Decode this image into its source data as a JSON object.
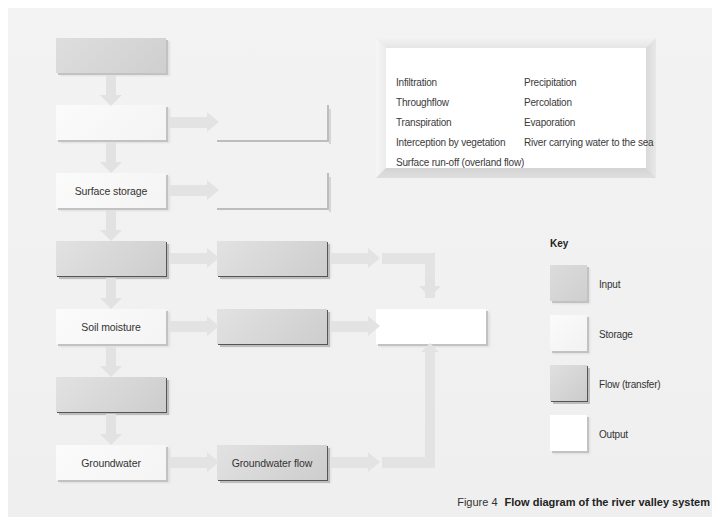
{
  "diagram": {
    "column1": [
      {
        "id": "c1r1",
        "type": "input",
        "label": ""
      },
      {
        "id": "c1r2",
        "type": "storage",
        "label": ""
      },
      {
        "id": "c1r3",
        "type": "storage",
        "label": "Surface storage"
      },
      {
        "id": "c1r4",
        "type": "flow",
        "label": ""
      },
      {
        "id": "c1r5",
        "type": "storage",
        "label": "Soil moisture"
      },
      {
        "id": "c1r6",
        "type": "flow",
        "label": ""
      },
      {
        "id": "c1r7",
        "type": "storage",
        "label": "Groundwater"
      }
    ],
    "column2": [
      {
        "id": "c2r2",
        "type": "output",
        "label": ""
      },
      {
        "id": "c2r3",
        "type": "output",
        "label": ""
      },
      {
        "id": "c2r4",
        "type": "flow",
        "label": ""
      },
      {
        "id": "c2r5",
        "type": "flow",
        "label": ""
      },
      {
        "id": "c2r7",
        "type": "flow",
        "label": "Groundwater flow"
      }
    ],
    "output_box": {
      "id": "c3r5",
      "type": "output",
      "label": ""
    }
  },
  "word_bank": {
    "left": [
      "Infiltration",
      "Throughflow",
      "Transpiration",
      "Interception by vegetation",
      "Surface run-off (overland flow)"
    ],
    "right": [
      "Precipitation",
      "Percolation",
      "Evaporation",
      "River carrying water to the sea"
    ]
  },
  "key": {
    "title": "Key",
    "items": [
      {
        "type": "input",
        "label": "Input"
      },
      {
        "type": "storage",
        "label": "Storage"
      },
      {
        "type": "flow",
        "label": "Flow (transfer)"
      },
      {
        "type": "output",
        "label": "Output"
      }
    ]
  },
  "caption": {
    "figure": "Figure 4",
    "title": "Flow diagram of the river valley system"
  },
  "colors": {
    "background": "#f2f2f2",
    "input": "#d4d4d4",
    "storage": "#f8f8f8",
    "flow": "#d6d6d6",
    "output": "#ffffff",
    "arrow": "#e3e3e3"
  }
}
